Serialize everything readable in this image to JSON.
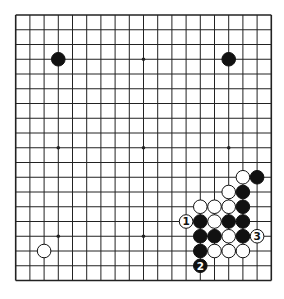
{
  "diagram": {
    "type": "go-board",
    "size": 19,
    "colors": {
      "background": "#ffffff",
      "line": "#222222",
      "black_stone": "#111111",
      "white_stone": "#ffffff",
      "stone_outline": "#111111"
    },
    "star_points": [
      [
        3,
        3
      ],
      [
        3,
        9
      ],
      [
        3,
        15
      ],
      [
        9,
        3
      ],
      [
        9,
        9
      ],
      [
        9,
        15
      ],
      [
        15,
        3
      ],
      [
        15,
        9
      ],
      [
        15,
        15
      ]
    ],
    "stones": [
      {
        "color": "black",
        "col": 3,
        "row": 3,
        "label": ""
      },
      {
        "color": "black",
        "col": 15,
        "row": 3,
        "label": ""
      },
      {
        "color": "white",
        "col": 2,
        "row": 16,
        "label": ""
      },
      {
        "color": "white",
        "col": 16,
        "row": 11,
        "label": ""
      },
      {
        "color": "black",
        "col": 17,
        "row": 11,
        "label": ""
      },
      {
        "color": "white",
        "col": 15,
        "row": 12,
        "label": ""
      },
      {
        "color": "black",
        "col": 16,
        "row": 12,
        "label": ""
      },
      {
        "color": "white",
        "col": 13,
        "row": 13,
        "label": ""
      },
      {
        "color": "white",
        "col": 14,
        "row": 13,
        "label": ""
      },
      {
        "color": "white",
        "col": 15,
        "row": 13,
        "label": ""
      },
      {
        "color": "black",
        "col": 16,
        "row": 13,
        "label": ""
      },
      {
        "color": "white",
        "col": 12,
        "row": 14,
        "label": "1"
      },
      {
        "color": "black",
        "col": 13,
        "row": 14,
        "label": ""
      },
      {
        "color": "white",
        "col": 14,
        "row": 14,
        "label": ""
      },
      {
        "color": "black",
        "col": 15,
        "row": 14,
        "label": ""
      },
      {
        "color": "black",
        "col": 16,
        "row": 14,
        "label": ""
      },
      {
        "color": "black",
        "col": 13,
        "row": 15,
        "label": ""
      },
      {
        "color": "black",
        "col": 14,
        "row": 15,
        "label": ""
      },
      {
        "color": "white",
        "col": 15,
        "row": 15,
        "label": ""
      },
      {
        "color": "black",
        "col": 16,
        "row": 15,
        "label": ""
      },
      {
        "color": "white",
        "col": 17,
        "row": 15,
        "label": "3"
      },
      {
        "color": "black",
        "col": 13,
        "row": 16,
        "label": ""
      },
      {
        "color": "white",
        "col": 14,
        "row": 16,
        "label": ""
      },
      {
        "color": "white",
        "col": 15,
        "row": 16,
        "label": ""
      },
      {
        "color": "white",
        "col": 16,
        "row": 16,
        "label": ""
      },
      {
        "color": "black",
        "col": 13,
        "row": 17,
        "label": "2"
      }
    ]
  }
}
